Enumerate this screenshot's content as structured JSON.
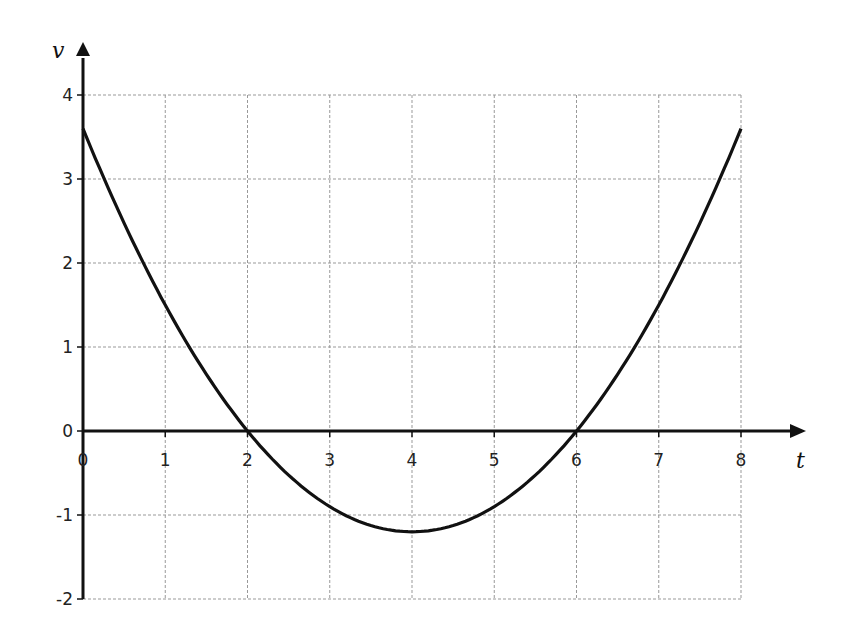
{
  "chart_data": {
    "type": "line",
    "title": "",
    "xlabel": "t",
    "ylabel": "v",
    "xlim": [
      0,
      8
    ],
    "ylim": [
      -2,
      4
    ],
    "grid": true,
    "x_ticks": [
      0,
      1,
      2,
      3,
      4,
      5,
      6,
      7,
      8
    ],
    "y_ticks": [
      -2,
      -1,
      0,
      1,
      2,
      3,
      4
    ],
    "x_tick_labels": [
      "0",
      "1",
      "2",
      "3",
      "4",
      "5",
      "6",
      "7",
      "8"
    ],
    "y_tick_labels": [
      "-2",
      "-1",
      "0",
      "1",
      "2",
      "3",
      "4"
    ],
    "series": [
      {
        "name": "v(t)",
        "description": "parabola v = 0.3(t-2)(t-6)",
        "x": [
          0,
          1,
          2,
          3,
          4,
          5,
          6,
          7,
          8
        ],
        "values": [
          3.6,
          1.5,
          0,
          -0.9,
          -1.2,
          -0.9,
          0,
          1.5,
          3.6
        ]
      }
    ],
    "colors": {
      "curve": "#111111",
      "grid": "#999999",
      "axis": "#111111"
    }
  }
}
